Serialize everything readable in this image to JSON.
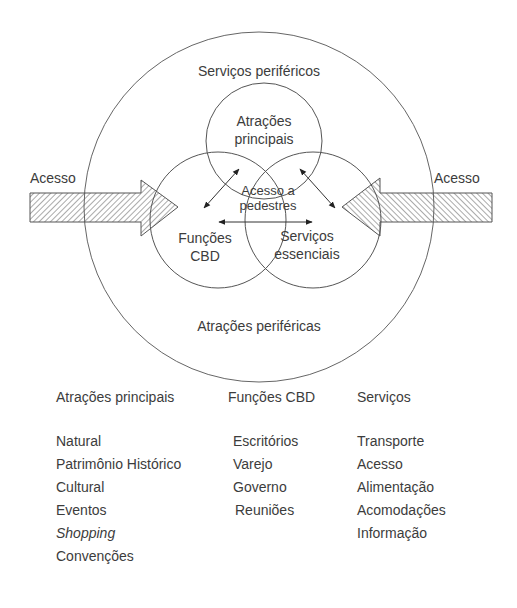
{
  "diagram": {
    "outer_label_top": "Serviços periféricos",
    "outer_label_bottom": "Atrações periféricas",
    "access_left": "Acesso",
    "access_right": "Acesso",
    "circle_top": {
      "line1": "Atrações",
      "line2": "principais"
    },
    "circle_left": {
      "line1": "Funções",
      "line2": "CBD"
    },
    "circle_right": {
      "line1": "Serviços",
      "line2": "essenciais"
    },
    "center": {
      "line1": "Acesso a",
      "line2": "pedestres"
    },
    "colors": {
      "stroke": "#555555",
      "text": "#3c3c3c",
      "background": "#ffffff"
    }
  },
  "legend": {
    "columns": [
      {
        "header": "Atrações principais",
        "items": [
          {
            "text": "Natural",
            "italic": false
          },
          {
            "text": "Patrimônio Histórico",
            "italic": false
          },
          {
            "text": "Cultural",
            "italic": false
          },
          {
            "text": "Eventos",
            "italic": false
          },
          {
            "text": "Shopping",
            "italic": true
          },
          {
            "text": "Convenções",
            "italic": false
          }
        ]
      },
      {
        "header": "Funções CBD",
        "items": [
          {
            "text": "Escritórios",
            "italic": false
          },
          {
            "text": "Varejo",
            "italic": false
          },
          {
            "text": "Governo",
            "italic": false
          },
          {
            "text": "Reuniões",
            "italic": false
          }
        ]
      },
      {
        "header": "Serviços",
        "items": [
          {
            "text": "Transporte",
            "italic": false
          },
          {
            "text": "Acesso",
            "italic": false
          },
          {
            "text": "Alimentação",
            "italic": false
          },
          {
            "text": "Acomodações",
            "italic": false
          },
          {
            "text": "Informação",
            "italic": false
          }
        ]
      }
    ]
  }
}
